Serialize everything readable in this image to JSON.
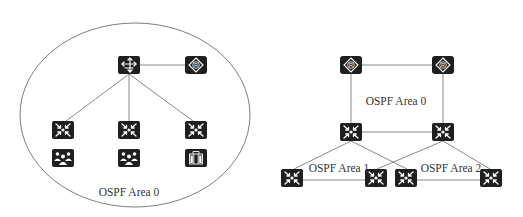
{
  "colors": {
    "device_fill": "#1f1f1f",
    "icon_stroke": "#ffffff",
    "link": "#7a7a7a",
    "label": "#333333",
    "background": "#ffffff"
  },
  "left_topology": {
    "area_label": "OSPF Area 0",
    "boundary": {
      "shape": "ellipse",
      "cx": 135,
      "cy": 115,
      "rx": 115,
      "ry": 92
    },
    "nodes": [
      {
        "id": "core",
        "type": "l3-switch",
        "x": 129,
        "y": 65
      },
      {
        "id": "router",
        "type": "router",
        "x": 196,
        "y": 65
      },
      {
        "id": "sw1",
        "type": "switch",
        "x": 63,
        "y": 130
      },
      {
        "id": "sw2",
        "type": "switch",
        "x": 129,
        "y": 130
      },
      {
        "id": "sw3",
        "type": "switch",
        "x": 196,
        "y": 130
      },
      {
        "id": "users1",
        "type": "user-group",
        "x": 63,
        "y": 158
      },
      {
        "id": "users2",
        "type": "user-group",
        "x": 129,
        "y": 158
      },
      {
        "id": "server",
        "type": "server-building",
        "x": 196,
        "y": 158
      }
    ],
    "links": [
      [
        "core",
        "router"
      ],
      [
        "core",
        "sw1"
      ],
      [
        "core",
        "sw2"
      ],
      [
        "core",
        "sw3"
      ]
    ]
  },
  "right_topology": {
    "area_labels": {
      "area0": "OSPF Area 0",
      "area1": "OSPF Area 1",
      "area2": "OSPF Area 2"
    },
    "nodes": [
      {
        "id": "r1",
        "type": "router",
        "x": 351,
        "y": 65
      },
      {
        "id": "r2",
        "type": "router",
        "x": 443,
        "y": 65
      },
      {
        "id": "abr1",
        "type": "switch",
        "x": 351,
        "y": 132
      },
      {
        "id": "abr2",
        "type": "switch",
        "x": 443,
        "y": 132
      },
      {
        "id": "a1s1",
        "type": "switch",
        "x": 292,
        "y": 178
      },
      {
        "id": "a1s2",
        "type": "switch",
        "x": 376,
        "y": 178
      },
      {
        "id": "a2s1",
        "type": "switch",
        "x": 406,
        "y": 178
      },
      {
        "id": "a2s2",
        "type": "switch",
        "x": 491,
        "y": 178
      }
    ],
    "links": [
      [
        "r1",
        "r2"
      ],
      [
        "r1",
        "abr1"
      ],
      [
        "r2",
        "abr2"
      ],
      [
        "abr1",
        "abr2"
      ],
      [
        "abr1",
        "a1s1"
      ],
      [
        "abr1",
        "a2s1"
      ],
      [
        "abr2",
        "a1s2"
      ],
      [
        "abr2",
        "a2s2"
      ],
      [
        "a1s1",
        "a1s2"
      ],
      [
        "a2s1",
        "a2s2"
      ]
    ]
  }
}
